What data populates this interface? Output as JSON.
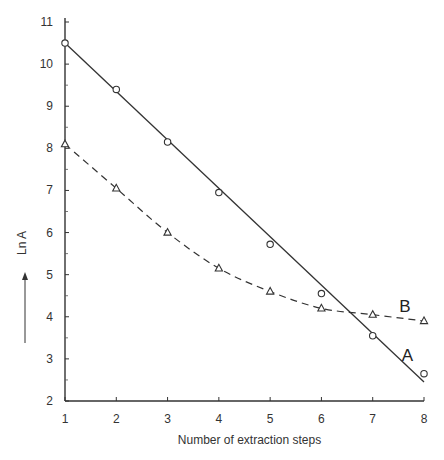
{
  "chart_data": {
    "type": "line",
    "title": "",
    "xlabel": "Number of extraction steps",
    "ylabel": "Ln A",
    "ylabel_arrow": "up-arrow",
    "xlim": [
      1,
      8
    ],
    "ylim": [
      2,
      11
    ],
    "x_ticks": [
      1,
      2,
      3,
      4,
      5,
      6,
      7,
      8
    ],
    "y_ticks": [
      2,
      3,
      4,
      5,
      6,
      7,
      8,
      9,
      10,
      11
    ],
    "grid": false,
    "legend": "none (inline series labels)",
    "x": [
      1,
      2,
      3,
      4,
      5,
      6,
      7,
      8
    ],
    "series": [
      {
        "name": "A",
        "marker": "circle",
        "line_style": "solid",
        "fit": "linear",
        "fit_line": [
          [
            1,
            10.5
          ],
          [
            8,
            2.45
          ]
        ],
        "values": [
          10.5,
          9.4,
          8.15,
          6.95,
          5.72,
          4.55,
          3.55,
          2.65
        ]
      },
      {
        "name": "B",
        "marker": "triangle",
        "line_style": "dashed",
        "fit": "curve",
        "values": [
          8.1,
          7.05,
          6.0,
          5.15,
          4.6,
          4.2,
          4.05,
          3.9
        ]
      }
    ],
    "annotations": [
      {
        "text": "A",
        "x": 7.6,
        "y": 3.1
      },
      {
        "text": "B",
        "x": 7.55,
        "y": 4.25
      }
    ]
  }
}
